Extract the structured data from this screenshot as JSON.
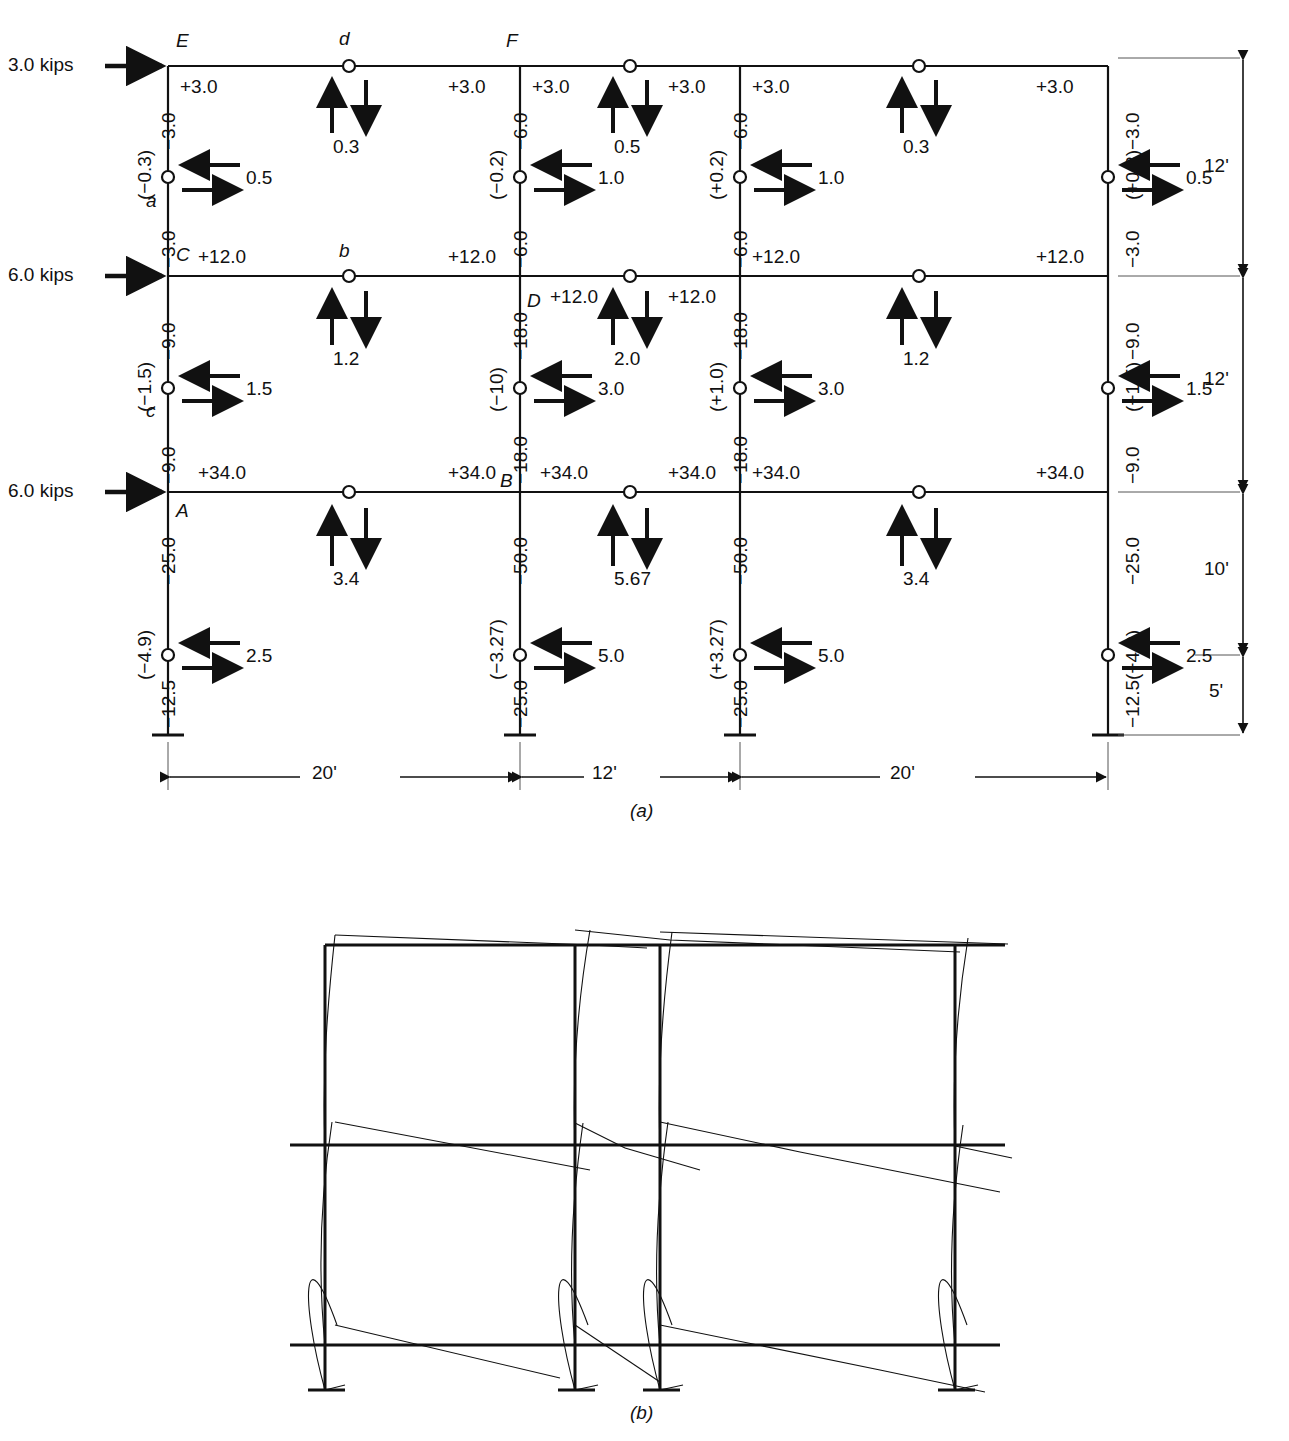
{
  "figure": {
    "subcaption_a": "(a)",
    "subcaption_b": "(b)",
    "units_note": "kips"
  },
  "loads": [
    {
      "label": "3.0 kips",
      "story": "roof"
    },
    {
      "label": "6.0 kips",
      "story": "third"
    },
    {
      "label": "6.0 kips",
      "story": "second"
    }
  ],
  "joint_labels": {
    "E": "E",
    "F": "F",
    "C": "C",
    "D": "D",
    "A": "A",
    "B": "B",
    "a": "a",
    "b": "b",
    "c": "c",
    "d": "d"
  },
  "spans": [
    {
      "label": "20'"
    },
    {
      "label": "12'"
    },
    {
      "label": "20'"
    }
  ],
  "story_heights": [
    {
      "label": "12'"
    },
    {
      "label": "12'"
    },
    {
      "label": "10'"
    },
    {
      "label": "5'"
    }
  ],
  "beam_moments": {
    "roof": [
      "+3.0",
      "+3.0",
      "+3.0",
      "+3.0",
      "+3.0",
      "+3.0"
    ],
    "third": [
      "+12.0",
      "+12.0",
      "+12.0",
      "+12.0",
      "+12.0",
      "+12.0"
    ],
    "second": [
      "+34.0",
      "+34.0",
      "+34.0",
      "+34.0",
      "+34.0",
      "+34.0"
    ]
  },
  "column_moments": {
    "story1_top": [
      "−3.0",
      "−6.0",
      "−6.0",
      "−3.0"
    ],
    "story1_bot": [
      "−3.0",
      "−6.0",
      "−6.0",
      "−3.0"
    ],
    "story2_top": [
      "−9.0",
      "−18.0",
      "−18.0",
      "−9.0"
    ],
    "story2_bot": [
      "−9.0",
      "−18.0",
      "−18.0",
      "−9.0"
    ],
    "story3_top": [
      "−25.0",
      "−50.0",
      "−50.0",
      "−25.0"
    ],
    "story3_bot": [
      "−12.5",
      "−25.0",
      "−25.0",
      "−12.5"
    ]
  },
  "column_axial": {
    "story1": [
      "(−0.3)",
      "(−0.2)",
      "(+0.2)",
      "(+0.3)"
    ],
    "story2": [
      "(−1.5)",
      "(−10)",
      "(+1.0)",
      "(+1.5)"
    ],
    "story3": [
      "(−4.9)",
      "(−3.27)",
      "(+3.27)",
      "(+4.9)"
    ]
  },
  "column_shears": {
    "story1": [
      "0.5",
      "1.0",
      "1.0",
      "0.5"
    ],
    "story2": [
      "1.5",
      "3.0",
      "3.0",
      "1.5"
    ],
    "story3": [
      "2.5",
      "5.0",
      "5.0",
      "2.5"
    ]
  },
  "beam_shears": {
    "roof": [
      "0.3",
      "0.5",
      "0.3"
    ],
    "third": [
      "1.2",
      "2.0",
      "1.2"
    ],
    "second": [
      "3.4",
      "5.67",
      "3.4"
    ]
  },
  "chart_data": {
    "type": "diagram",
    "bays_ft": [
      20,
      12,
      20
    ],
    "story_heights_ft": [
      12,
      12,
      15
    ],
    "lateral_loads_kips": [
      3.0,
      6.0,
      6.0
    ],
    "hinge_locations": "beam midspans and column mid-heights"
  }
}
